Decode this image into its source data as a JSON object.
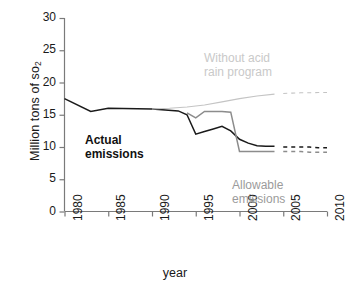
{
  "chart_data": {
    "type": "line",
    "title": "",
    "xlabel": "year",
    "ylabel": "Million tons of so",
    "ylabel_sub": "2",
    "xlim": [
      1980,
      2010
    ],
    "ylim": [
      0,
      30
    ],
    "yticks": [
      0,
      5,
      10,
      15,
      20,
      25,
      30
    ],
    "xticks": [
      1980,
      1985,
      1990,
      1995,
      2000,
      2005,
      2010
    ],
    "grid": false,
    "legend": "annotations-in-plot",
    "series": [
      {
        "name": "Actual emissions",
        "color": "#1a1a1a",
        "style": "solid",
        "x": [
          1980,
          1983,
          1985,
          1990,
          1993,
          1994,
          1995,
          1996,
          1997,
          1998,
          1999,
          2000,
          2001,
          2002,
          2003,
          2004
        ],
        "values": [
          17.5,
          15.5,
          16.0,
          15.9,
          15.6,
          15.0,
          12.0,
          12.4,
          12.8,
          13.2,
          12.5,
          11.2,
          10.6,
          10.2,
          10.1,
          10.1
        ]
      },
      {
        "name": "Actual emissions (projected)",
        "color": "#1a1a1a",
        "style": "dashed",
        "x": [
          2005,
          2006,
          2007,
          2008,
          2009,
          2010
        ],
        "values": [
          10.0,
          10.0,
          10.0,
          10.0,
          9.9,
          9.9
        ]
      },
      {
        "name": "Allowable emissions",
        "color": "#8c8c8c",
        "style": "solid",
        "x": [
          1994,
          1995,
          1996,
          1997,
          1998,
          1999,
          2000,
          2001,
          2002,
          2003,
          2004
        ],
        "values": [
          15.3,
          14.5,
          15.5,
          15.5,
          15.5,
          15.4,
          9.3,
          9.3,
          9.3,
          9.3,
          9.3
        ]
      },
      {
        "name": "Allowable emissions (projected)",
        "color": "#8c8c8c",
        "style": "dashed",
        "x": [
          2005,
          2006,
          2007,
          2008,
          2009,
          2010
        ],
        "values": [
          9.3,
          9.3,
          9.3,
          9.2,
          9.2,
          9.2
        ]
      },
      {
        "name": "Without acid rain program",
        "color": "#c4c4c4",
        "style": "solid",
        "x": [
          1990,
          1992,
          1994,
          1996,
          1998,
          2000,
          2002,
          2004
        ],
        "values": [
          15.9,
          16.0,
          16.2,
          16.5,
          17.0,
          17.5,
          17.9,
          18.2
        ]
      },
      {
        "name": "Without acid rain program (projected)",
        "color": "#c4c4c4",
        "style": "dashed",
        "x": [
          2005,
          2006,
          2007,
          2008,
          2009,
          2010
        ],
        "values": [
          18.3,
          18.35,
          18.4,
          18.4,
          18.45,
          18.45
        ]
      }
    ],
    "annotations": [
      {
        "id": "actual",
        "text": "Actual\nemissions",
        "color": "#111111",
        "bold": true
      },
      {
        "id": "without",
        "text": "Without acid\nrain program",
        "color": "#c9c9c9",
        "bold": false
      },
      {
        "id": "allowable",
        "text": "Allowable\nemissions",
        "color": "#9b9b9b",
        "bold": false
      }
    ]
  },
  "axes": {
    "y_tick_labels": [
      "30",
      "25",
      "20",
      "15",
      "10",
      "5",
      "0"
    ],
    "x_tick_labels": [
      "1980",
      "1985",
      "1990",
      "1995",
      "2000",
      "2005",
      "2010"
    ],
    "y_axis_title": "Million tons of so",
    "y_axis_title_sub": "2",
    "x_axis_title": "year"
  },
  "annotations": {
    "actual": "Actual\nemissions",
    "without": "Without acid\nrain program",
    "allowable": "Allowable\nemissions"
  }
}
